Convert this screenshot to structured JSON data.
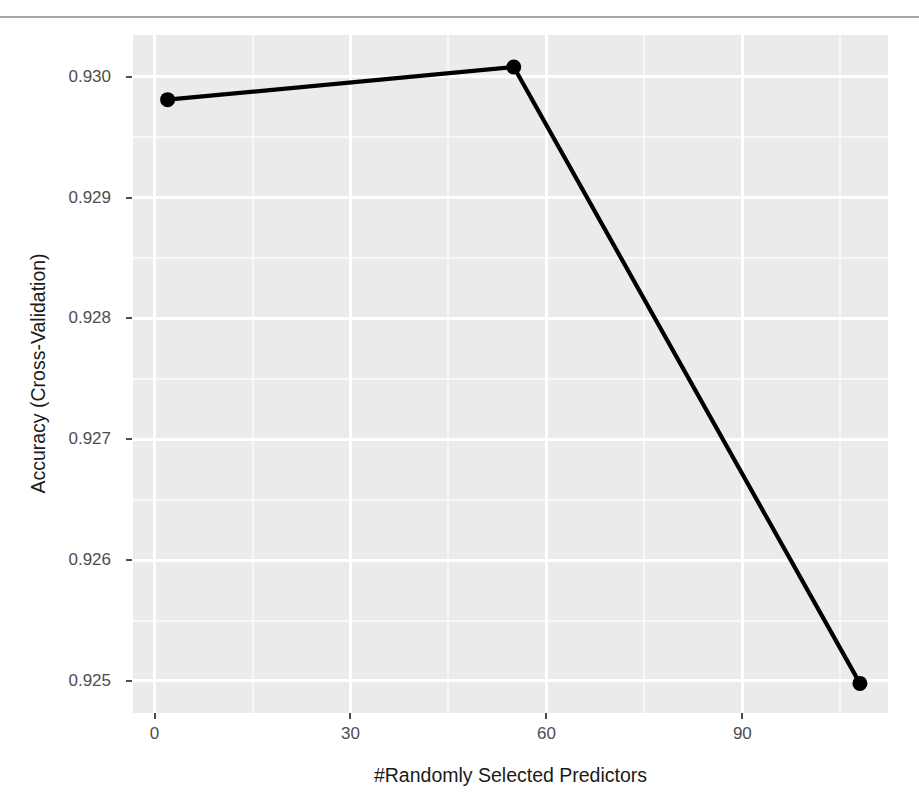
{
  "page": {
    "top_rule_fragment": "",
    "background_color": "#ffffff"
  },
  "chart_data": {
    "type": "line",
    "title": "",
    "subtitle": "",
    "xlabel": "#Randomly Selected Predictors",
    "ylabel": "Accuracy (Cross-Validation)",
    "x": [
      2,
      55,
      108
    ],
    "values": [
      0.92981,
      0.93008,
      0.92498
    ],
    "series": [
      {
        "name": "Accuracy (Cross-Validation)",
        "x": [
          2,
          55,
          108
        ],
        "values": [
          0.92981,
          0.93008,
          0.92498
        ]
      }
    ],
    "xlim": [
      -3.3,
      112.3
    ],
    "ylim": [
      0.924735,
      0.930345
    ],
    "x_ticks": [
      0,
      30,
      60,
      90
    ],
    "x_tick_labels": [
      "0",
      "30",
      "60",
      "90"
    ],
    "y_ticks": [
      0.925,
      0.926,
      0.927,
      0.928,
      0.929,
      0.93
    ],
    "y_tick_labels": [
      "0.925",
      "0.926",
      "0.927",
      "0.928",
      "0.929",
      "0.930"
    ],
    "x_minor_ticks": [
      15,
      45,
      75,
      105
    ],
    "y_minor_ticks": [
      0.9255,
      0.9265,
      0.9275,
      0.9285,
      0.9295
    ],
    "grid": true,
    "legend": "none",
    "line_color": "#000000",
    "point_color": "#000000",
    "point_shape": "circle",
    "panel_background": "#ebebeb",
    "grid_color": "#ffffff",
    "tick_label_color": "#4d4d4d",
    "axis_title_color": "#1b1b1b"
  }
}
